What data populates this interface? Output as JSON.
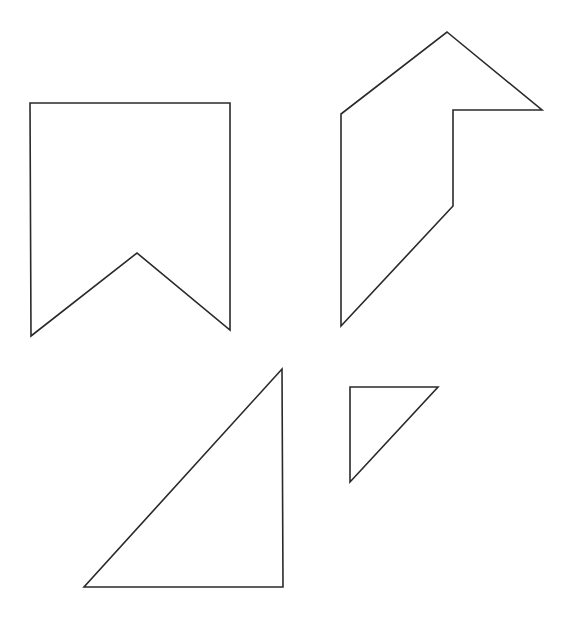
{
  "canvas": {
    "width": 565,
    "height": 617,
    "background": "#ffffff",
    "stroke_color": "#2a2a2a"
  },
  "shapes": [
    {
      "name": "banner-pentagon",
      "points": "30,103 230,103 230,330 137,253 31,336"
    },
    {
      "name": "arrow-hexagon",
      "points": "447,32 542,110 453,110 453,206 341,326 341,114"
    },
    {
      "name": "large-right-triangle",
      "points": "282,369 283,587 84,587"
    },
    {
      "name": "small-right-triangle",
      "points": "350,387 438,387 350,482"
    }
  ]
}
